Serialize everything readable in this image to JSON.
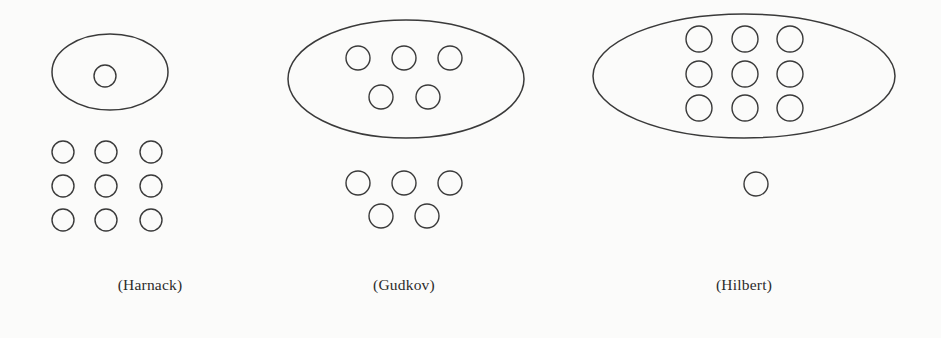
{
  "figure": {
    "background_color": "#fbfbfa",
    "stroke_color": "#3a3a3a",
    "caption_color": "#2b2b2b",
    "width": 941,
    "height": 338
  },
  "groups": [
    {
      "id": "harnack",
      "caption": "(Harnack)",
      "caption_x": 150,
      "caption_y": 290,
      "outer_oval": {
        "cx": 110,
        "cy": 72,
        "rx": 58,
        "ry": 38
      },
      "inner_ovals": [
        {
          "cx": 105,
          "cy": 76,
          "r": 11
        }
      ],
      "free_ovals": [
        {
          "cx": 63,
          "cy": 152,
          "r": 11
        },
        {
          "cx": 106,
          "cy": 152,
          "r": 11
        },
        {
          "cx": 151,
          "cy": 152,
          "r": 11
        },
        {
          "cx": 63,
          "cy": 186,
          "r": 11
        },
        {
          "cx": 106,
          "cy": 186,
          "r": 11
        },
        {
          "cx": 151,
          "cy": 186,
          "r": 11
        },
        {
          "cx": 63,
          "cy": 220,
          "r": 11
        },
        {
          "cx": 106,
          "cy": 220,
          "r": 11
        },
        {
          "cx": 151,
          "cy": 220,
          "r": 11
        }
      ]
    },
    {
      "id": "gudkov",
      "caption": "(Gudkov)",
      "caption_x": 404,
      "caption_y": 290,
      "outer_oval": {
        "cx": 406,
        "cy": 79,
        "rx": 118,
        "ry": 59
      },
      "inner_ovals": [
        {
          "cx": 358,
          "cy": 58,
          "r": 12
        },
        {
          "cx": 404,
          "cy": 58,
          "r": 12
        },
        {
          "cx": 450,
          "cy": 58,
          "r": 12
        },
        {
          "cx": 381,
          "cy": 97,
          "r": 12
        },
        {
          "cx": 428,
          "cy": 97,
          "r": 12
        }
      ],
      "free_ovals": [
        {
          "cx": 358,
          "cy": 183,
          "r": 12
        },
        {
          "cx": 404,
          "cy": 183,
          "r": 12
        },
        {
          "cx": 450,
          "cy": 183,
          "r": 12
        },
        {
          "cx": 381,
          "cy": 216,
          "r": 12
        },
        {
          "cx": 427,
          "cy": 216,
          "r": 12
        }
      ]
    },
    {
      "id": "hilbert",
      "caption": "(Hilbert)",
      "caption_x": 744,
      "caption_y": 290,
      "outer_oval": {
        "cx": 744,
        "cy": 76,
        "rx": 151,
        "ry": 62
      },
      "inner_ovals": [
        {
          "cx": 699,
          "cy": 39,
          "r": 13
        },
        {
          "cx": 745,
          "cy": 39,
          "r": 13
        },
        {
          "cx": 790,
          "cy": 39,
          "r": 13
        },
        {
          "cx": 699,
          "cy": 74,
          "r": 13
        },
        {
          "cx": 745,
          "cy": 74,
          "r": 13
        },
        {
          "cx": 790,
          "cy": 74,
          "r": 13
        },
        {
          "cx": 699,
          "cy": 108,
          "r": 13
        },
        {
          "cx": 745,
          "cy": 108,
          "r": 13
        },
        {
          "cx": 790,
          "cy": 108,
          "r": 13
        }
      ],
      "free_ovals": [
        {
          "cx": 756,
          "cy": 184,
          "r": 12
        }
      ]
    }
  ]
}
